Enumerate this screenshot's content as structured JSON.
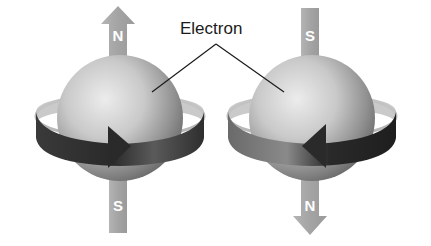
{
  "diagram": {
    "label": "Electron",
    "electrons": [
      {
        "id": "left",
        "top_pole": "N",
        "bottom_pole": "S",
        "arrow_end": "top",
        "spin_direction": "right"
      },
      {
        "id": "right",
        "top_pole": "S",
        "bottom_pole": "N",
        "arrow_end": "bottom",
        "spin_direction": "left"
      }
    ],
    "colors": {
      "background": "#ffffff",
      "pole_bar": "#a8a8a8",
      "sphere_light": "#e6e6e6",
      "sphere_dark": "#6e6e6e",
      "ring_dark": "#2a2a2a",
      "ring_light": "#b5b5b5",
      "text": "#1a1a1a"
    }
  }
}
